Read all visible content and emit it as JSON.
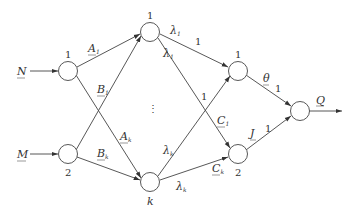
{
  "diagram": {
    "type": "network-flow",
    "colors": {
      "stroke": "#444444",
      "text": "#333333",
      "background": "#ffffff"
    },
    "inputs": [
      {
        "id": "N",
        "label": "N",
        "target": "in1"
      },
      {
        "id": "M",
        "label": "M",
        "target": "in2"
      }
    ],
    "output": {
      "id": "Q",
      "label": "Q",
      "source": "out"
    },
    "nodes": {
      "in1": {
        "label": "1"
      },
      "in2": {
        "label": "2"
      },
      "h1": {
        "label": "1"
      },
      "hk": {
        "label": "k"
      },
      "o1": {
        "label": "1"
      },
      "o2": {
        "label": "2"
      },
      "out": {
        "label": ""
      }
    },
    "ellipsis": "⋮",
    "edges": {
      "in1_h1": {
        "label": "A",
        "sub": "1"
      },
      "in2_h1": {
        "label": "B",
        "sub": "1"
      },
      "in1_hk": {
        "label": "A",
        "sub": "k"
      },
      "in2_hk": {
        "label": "B",
        "sub": "k"
      },
      "h1_o1": {
        "label": "λ",
        "sub": "1",
        "weight": "1"
      },
      "h1_o2": {
        "label": "λ",
        "sub": "1",
        "weight": ""
      },
      "hk_o1": {
        "label": "λ",
        "sub": "k",
        "weight": "1"
      },
      "hk_o2": {
        "label": "λ",
        "sub": "k",
        "weight": ""
      },
      "h1_o2_c": {
        "label": "C",
        "sub": "1"
      },
      "hk_o2_c": {
        "label": "C",
        "sub": "k"
      },
      "o1_out": {
        "label": "θ",
        "weight": "1"
      },
      "o2_out": {
        "label": "J",
        "weight": "1"
      }
    }
  }
}
